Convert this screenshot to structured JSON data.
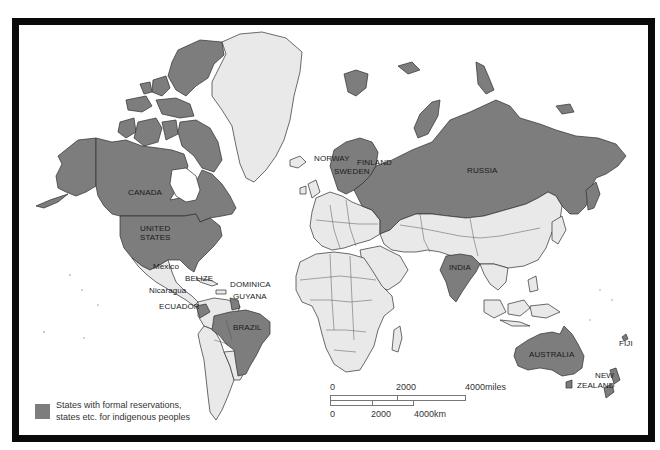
{
  "map": {
    "colors": {
      "highlighted": "#7d7d7d",
      "other_land": "#e9e9e9",
      "ocean": "#ffffff",
      "border": "#0a0a0a",
      "outline": "#333333"
    },
    "labels": {
      "canada": "CANADA",
      "united_states_1": "UNITED",
      "united_states_2": "STATES",
      "mexico": "Mexico",
      "belize": "BELIZE",
      "nicaragua": "Nicaragua",
      "dominica": "DOMINICA",
      "guyana": "GUYANA",
      "ecuador": "ECUADOR",
      "brazil": "BRAZIL",
      "norway": "NORWAY",
      "finland": "FINLAND",
      "sweden": "SWEDEN",
      "russia": "RUSSIA",
      "india": "INDIA",
      "australia": "AUSTRALIA",
      "new_zealand_1": "NEW",
      "new_zealand_2": "ZEALAND",
      "fiji": "FIJI"
    },
    "highlighted_states": [
      "Canada",
      "United States",
      "Ecuador",
      "Brazil",
      "Norway",
      "Sweden",
      "Finland",
      "Russia",
      "India",
      "Australia",
      "New Zealand",
      "Alaska",
      "Guyana (part)"
    ]
  },
  "legend": {
    "line1": "States with formal reservations,",
    "line2": "states etc. for indigenous peoples"
  },
  "scale_bar": {
    "miles": {
      "start": "0",
      "mid": "2000",
      "end": "4000miles"
    },
    "km": {
      "start": "0",
      "mid": "2000",
      "end": "4000km"
    }
  }
}
